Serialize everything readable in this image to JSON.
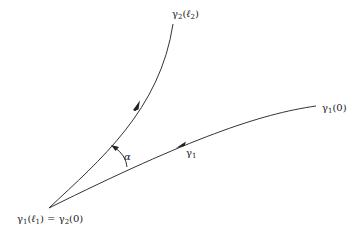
{
  "diagram": {
    "stroke_color": "#333333",
    "curves": [
      {
        "id": "gamma1",
        "label": "γ",
        "label_sub": "1",
        "start_label": "γ",
        "start_label_sub": "1",
        "start_label_arg": "(0)"
      },
      {
        "id": "gamma2",
        "label_main": "γ",
        "label_sub": "2",
        "end_label_open": "(",
        "end_label_ell": "ℓ",
        "end_label_ell_sub": "2",
        "end_label_close": ")"
      }
    ],
    "origin_label": {
      "lhs_main": "γ",
      "lhs_sub": "1",
      "lhs_open": "(",
      "lhs_ell": "ℓ",
      "lhs_ell_sub": "1",
      "lhs_close": ")",
      "equals": " = ",
      "rhs_main": "γ",
      "rhs_sub": "2",
      "rhs_arg": "(0)"
    },
    "angle_label": "α"
  }
}
